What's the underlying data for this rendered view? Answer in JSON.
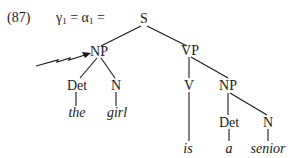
{
  "example": {
    "number": "(87)",
    "equation": {
      "lhs_symbol": "γ",
      "lhs_subscript": "1",
      "mid_symbol": "α",
      "mid_subscript": "1",
      "equals": "="
    }
  },
  "tree": {
    "root": "S",
    "subject_np": "NP",
    "subject_det": "Det",
    "subject_n": "N",
    "subject_det_word": "the",
    "subject_n_word": "girl",
    "vp": "VP",
    "verb": "V",
    "verb_word": "is",
    "object_np": "NP",
    "object_det": "Det",
    "object_n": "N",
    "object_det_word": "a",
    "object_n_word": "senior"
  },
  "annotations": {
    "arrow_target": "NP",
    "arrow_style": "lightning-arrow"
  }
}
